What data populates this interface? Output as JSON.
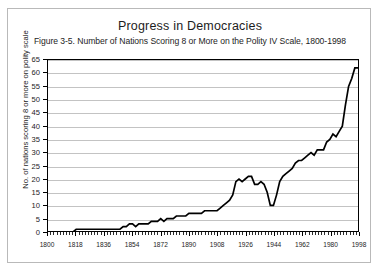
{
  "figure": {
    "title": "Progress in Democracies",
    "subtitle": "Figure 3-5. Number of Nations Scoring 8 or More on the Polity IV Scale, 1800-1998"
  },
  "colors": {
    "line": "#000000",
    "gridline": "#c3c3c3",
    "axis": "#000000",
    "frame_border": "#b9b9b9",
    "background": "#ffffff",
    "text": "#1d1d1d"
  },
  "chart_data": {
    "type": "line",
    "title": "Progress in Democracies",
    "subtitle": "Figure 3-5. Number of Nations Scoring 8 or More on the Polity IV Scale, 1800-1998",
    "xlabel": "",
    "ylabel": "No. of nations scoring 8 or more on polity scale",
    "xlim": [
      1800,
      1998
    ],
    "ylim": [
      0,
      65
    ],
    "ytick_step": 5,
    "yticks": [
      0,
      5,
      10,
      15,
      20,
      25,
      30,
      35,
      40,
      45,
      50,
      55,
      60,
      65
    ],
    "xticks": [
      1800,
      1818,
      1836,
      1854,
      1872,
      1890,
      1908,
      1926,
      1944,
      1962,
      1980,
      1998
    ],
    "xtick_labels": [
      "1800",
      "1818",
      "1836",
      "1854",
      "1872",
      "1890",
      "1908",
      "1926",
      "1944",
      "1962",
      "1980",
      "1998"
    ],
    "x_minor_tick_interval": 2,
    "grid": "horizontal",
    "legend": "none",
    "series": [
      {
        "name": "Nations scoring 8 or more on Polity IV scale",
        "color": "#000000",
        "x": [
          1800,
          1802,
          1804,
          1806,
          1808,
          1810,
          1812,
          1814,
          1816,
          1818,
          1820,
          1822,
          1824,
          1826,
          1828,
          1830,
          1832,
          1834,
          1836,
          1838,
          1840,
          1842,
          1844,
          1846,
          1848,
          1850,
          1852,
          1854,
          1856,
          1858,
          1860,
          1862,
          1864,
          1866,
          1868,
          1870,
          1872,
          1874,
          1876,
          1878,
          1880,
          1882,
          1884,
          1886,
          1888,
          1890,
          1892,
          1894,
          1896,
          1898,
          1900,
          1902,
          1904,
          1906,
          1908,
          1910,
          1912,
          1914,
          1916,
          1918,
          1920,
          1922,
          1924,
          1926,
          1928,
          1930,
          1932,
          1934,
          1936,
          1938,
          1940,
          1942,
          1944,
          1946,
          1948,
          1950,
          1952,
          1954,
          1956,
          1958,
          1960,
          1962,
          1964,
          1966,
          1968,
          1970,
          1972,
          1974,
          1976,
          1978,
          1980,
          1982,
          1984,
          1986,
          1988,
          1990,
          1992,
          1994,
          1996,
          1998
        ],
        "values": [
          0,
          0,
          0,
          0,
          0,
          0,
          0,
          0,
          0,
          1,
          1,
          1,
          1,
          1,
          1,
          1,
          1,
          1,
          1,
          1,
          1,
          1,
          1,
          1,
          2,
          2,
          3,
          3,
          2,
          3,
          3,
          3,
          3,
          4,
          4,
          4,
          5,
          4,
          5,
          5,
          5,
          6,
          6,
          6,
          6,
          7,
          7,
          7,
          7,
          7,
          8,
          8,
          8,
          8,
          8,
          9,
          10,
          11,
          12,
          14,
          19,
          20,
          19,
          20,
          21,
          21,
          18,
          18,
          19,
          18,
          15,
          10,
          10,
          14,
          19,
          21,
          22,
          23,
          24,
          26,
          27,
          27,
          28,
          29,
          30,
          29,
          31,
          31,
          31,
          34,
          35,
          37,
          36,
          38,
          40,
          48,
          55,
          58,
          62,
          62
        ]
      }
    ],
    "notable_features": [
      {
        "label": "flat near 1 nation",
        "x_range": [
          1818,
          1846
        ],
        "value": 1
      },
      {
        "label": "WWI surge peak",
        "x": 1928,
        "value": 21
      },
      {
        "label": "WWII trough",
        "x": 1942,
        "value": 10
      },
      {
        "label": "post-Cold-War surge",
        "x_range": [
          1990,
          1998
        ],
        "value_range": [
          48,
          63
        ]
      },
      {
        "label": "maximum",
        "x": 1996,
        "value": 62
      }
    ]
  }
}
